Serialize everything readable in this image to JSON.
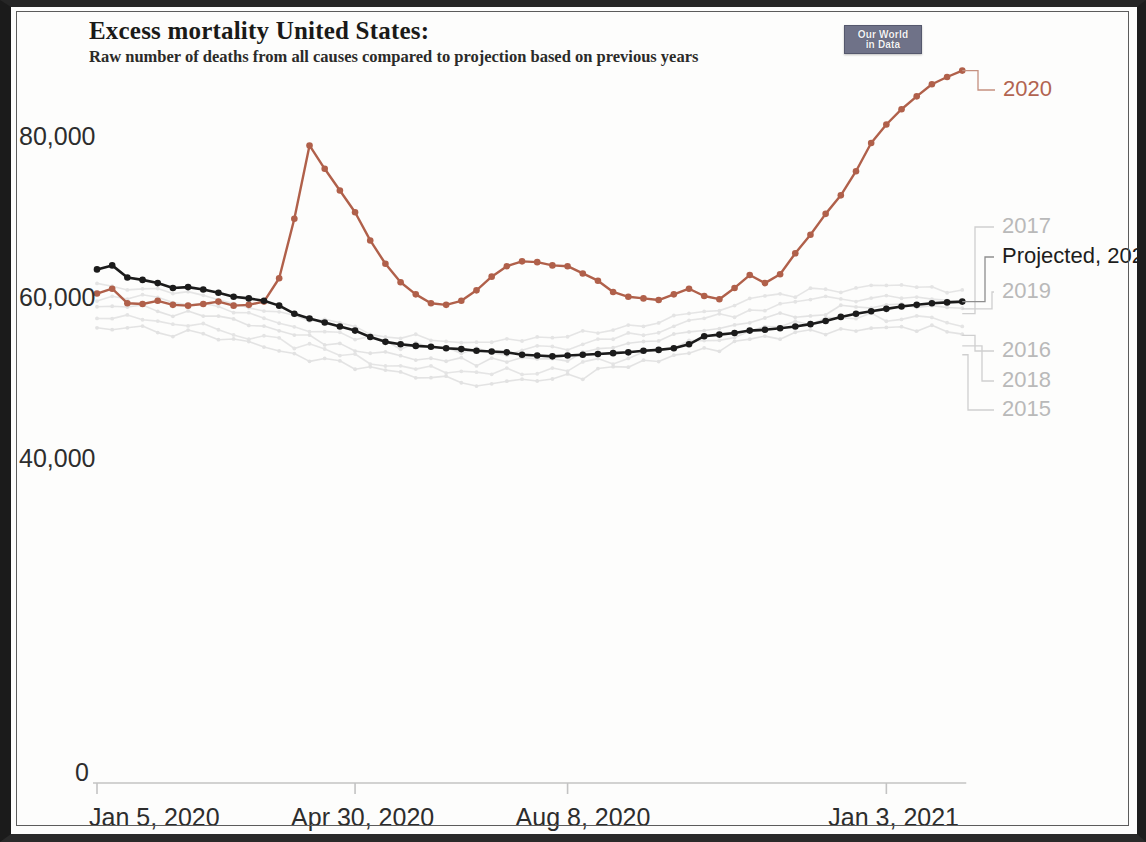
{
  "header": {
    "title": "Excess mortality United States:",
    "subtitle": "Raw number of deaths from all causes compared to projection based on previous years",
    "logo_line1": "Our World",
    "logo_line2": "in Data"
  },
  "colors": {
    "series_2020": "#b0604a",
    "series_projected": "#1b1b1b",
    "historic_years": "#e2e2e2",
    "axis": "#bfbfbf",
    "text": "#2d2d2d"
  },
  "legend": [
    {
      "label": "2020",
      "color_key": "series_2020",
      "style": "red"
    },
    {
      "label": "2017",
      "color_key": "historic_years",
      "style": "grey"
    },
    {
      "label": "Projected, 2020",
      "color_key": "series_projected",
      "style": "black"
    },
    {
      "label": "2019",
      "color_key": "historic_years",
      "style": "grey"
    },
    {
      "label": "2016",
      "color_key": "historic_years",
      "style": "grey"
    },
    {
      "label": "2018",
      "color_key": "historic_years",
      "style": "grey"
    },
    {
      "label": "2015",
      "color_key": "historic_years",
      "style": "grey"
    }
  ],
  "chart_data": {
    "type": "line",
    "title": "Excess mortality United States:",
    "subtitle": "Raw number of deaths from all causes compared to projection based on previous years",
    "xlabel": "",
    "ylabel": "",
    "ylim": [
      0,
      92000
    ],
    "yticks": [
      0,
      40000,
      60000,
      80000
    ],
    "ytick_labels": [
      "0",
      "40,000",
      "60,000",
      "80,000"
    ],
    "xtick_labels": [
      "Jan 5, 2020",
      "Apr 30, 2020",
      "Aug 8, 2020",
      "Jan 3, 2021"
    ],
    "xtick_indices": [
      0,
      17,
      31,
      52
    ],
    "grid": false,
    "legend_position": "right-direct-labels",
    "x": [
      "Jan 5, 2020",
      "Jan 12, 2020",
      "Jan 19, 2020",
      "Jan 26, 2020",
      "Feb 2, 2020",
      "Feb 9, 2020",
      "Feb 16, 2020",
      "Feb 23, 2020",
      "Mar 1, 2020",
      "Mar 8, 2020",
      "Mar 15, 2020",
      "Mar 22, 2020",
      "Mar 29, 2020",
      "Apr 5, 2020",
      "Apr 12, 2020",
      "Apr 19, 2020",
      "Apr 26, 2020",
      "Apr 30, 2020",
      "May 10, 2020",
      "May 17, 2020",
      "May 24, 2020",
      "May 31, 2020",
      "Jun 7, 2020",
      "Jun 14, 2020",
      "Jun 21, 2020",
      "Jun 28, 2020",
      "Jul 5, 2020",
      "Jul 12, 2020",
      "Jul 19, 2020",
      "Jul 26, 2020",
      "Aug 2, 2020",
      "Aug 8, 2020",
      "Aug 16, 2020",
      "Aug 23, 2020",
      "Aug 30, 2020",
      "Sep 6, 2020",
      "Sep 13, 2020",
      "Sep 20, 2020",
      "Sep 27, 2020",
      "Oct 4, 2020",
      "Oct 11, 2020",
      "Oct 18, 2020",
      "Oct 25, 2020",
      "Nov 1, 2020",
      "Nov 8, 2020",
      "Nov 15, 2020",
      "Nov 22, 2020",
      "Nov 29, 2020",
      "Dec 6, 2020",
      "Dec 13, 2020",
      "Dec 20, 2020",
      "Dec 27, 2020",
      "Jan 3, 2021",
      "Jan 10, 2021",
      "Jan 17, 2021",
      "Jan 24, 2021",
      "Jan 31, 2021",
      "Feb 7, 2021"
    ],
    "series": [
      {
        "name": "2020",
        "color": "#b0604a",
        "values": [
          60800,
          61400,
          59600,
          59500,
          59900,
          59400,
          59300,
          59500,
          59800,
          59300,
          59400,
          59800,
          62700,
          70100,
          79200,
          76300,
          73600,
          70900,
          67400,
          64500,
          62200,
          60700,
          59600,
          59400,
          59900,
          61200,
          62900,
          64200,
          64800,
          64700,
          64300,
          64200,
          63300,
          62400,
          61000,
          60400,
          60200,
          60000,
          60700,
          61400,
          60500,
          60100,
          61500,
          63100,
          62100,
          63200,
          65800,
          68100,
          70700,
          73000,
          76000,
          79500,
          81800,
          83700,
          85300,
          86800,
          87700,
          88500
        ]
      },
      {
        "name": "Projected, 2020",
        "color": "#1b1b1b",
        "values": [
          63800,
          64300,
          62800,
          62500,
          62100,
          61500,
          61600,
          61300,
          60900,
          60400,
          60200,
          59900,
          59300,
          58300,
          57700,
          57200,
          56700,
          56200,
          55400,
          54800,
          54500,
          54300,
          54200,
          54000,
          53900,
          53700,
          53600,
          53500,
          53200,
          53100,
          53000,
          53100,
          53200,
          53300,
          53400,
          53500,
          53700,
          53800,
          54000,
          54500,
          55500,
          55700,
          55900,
          56200,
          56300,
          56500,
          56700,
          57000,
          57400,
          57900,
          58300,
          58600,
          58900,
          59200,
          59400,
          59600,
          59700,
          59800
        ]
      }
    ],
    "historic_series": [
      {
        "name": "2015",
        "color": "#e4e4e4"
      },
      {
        "name": "2016",
        "color": "#e4e4e4"
      },
      {
        "name": "2017",
        "color": "#e2e2e2"
      },
      {
        "name": "2018",
        "color": "#e4e4e4"
      },
      {
        "name": "2019",
        "color": "#e2e2e2"
      }
    ]
  }
}
